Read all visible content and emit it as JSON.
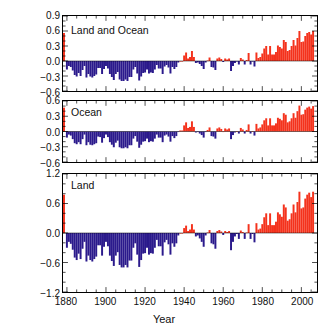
{
  "chart_data": {
    "type": "bar",
    "title": "",
    "xlabel": "Year",
    "ylabel": "Temperature anomaly (°C)",
    "xlim": [
      1878,
      2008
    ],
    "grid": false,
    "legend": "none",
    "colors": {
      "positive": "#f4321c",
      "negative": "#2b1a8c",
      "axis": "#000000"
    },
    "xticks": [
      1880,
      1900,
      1920,
      1940,
      1960,
      1980,
      2000
    ],
    "panels": [
      {
        "name": "Land and Ocean",
        "ylabel_ticks": [
          "0.9",
          "0.6",
          "0.3",
          "0.0",
          "-0.3",
          "-0.6"
        ],
        "ylim": [
          -0.6,
          0.9
        ],
        "ytick_values": [
          0.9,
          0.6,
          0.3,
          0.0,
          -0.3,
          -0.6
        ],
        "x": [
          1880,
          1881,
          1882,
          1883,
          1884,
          1885,
          1886,
          1887,
          1888,
          1889,
          1890,
          1891,
          1892,
          1893,
          1894,
          1895,
          1896,
          1897,
          1898,
          1899,
          1900,
          1901,
          1902,
          1903,
          1904,
          1905,
          1906,
          1907,
          1908,
          1909,
          1910,
          1911,
          1912,
          1913,
          1914,
          1915,
          1916,
          1917,
          1918,
          1919,
          1920,
          1921,
          1922,
          1923,
          1924,
          1925,
          1926,
          1927,
          1928,
          1929,
          1930,
          1931,
          1932,
          1933,
          1934,
          1935,
          1936,
          1937,
          1938,
          1939,
          1940,
          1941,
          1942,
          1943,
          1944,
          1945,
          1946,
          1947,
          1948,
          1949,
          1950,
          1951,
          1952,
          1953,
          1954,
          1955,
          1956,
          1957,
          1958,
          1959,
          1960,
          1961,
          1962,
          1963,
          1964,
          1965,
          1966,
          1967,
          1968,
          1969,
          1970,
          1971,
          1972,
          1973,
          1974,
          1975,
          1976,
          1977,
          1978,
          1979,
          1980,
          1981,
          1982,
          1983,
          1984,
          1985,
          1986,
          1987,
          1988,
          1989,
          1990,
          1991,
          1992,
          1993,
          1994,
          1995,
          1996,
          1997,
          1998,
          1999,
          2000,
          2001,
          2002,
          2003,
          2004,
          2005,
          2006
        ],
        "values": [
          -0.17,
          -0.1,
          -0.12,
          -0.19,
          -0.28,
          -0.31,
          -0.24,
          -0.3,
          -0.18,
          -0.1,
          -0.33,
          -0.26,
          -0.31,
          -0.33,
          -0.3,
          -0.27,
          -0.14,
          -0.14,
          -0.26,
          -0.16,
          -0.1,
          -0.15,
          -0.26,
          -0.32,
          -0.38,
          -0.26,
          -0.22,
          -0.37,
          -0.4,
          -0.4,
          -0.37,
          -0.4,
          -0.32,
          -0.32,
          -0.17,
          -0.12,
          -0.25,
          -0.39,
          -0.31,
          -0.24,
          -0.23,
          -0.17,
          -0.25,
          -0.23,
          -0.24,
          -0.17,
          -0.08,
          -0.15,
          -0.15,
          -0.26,
          -0.11,
          -0.08,
          -0.13,
          -0.25,
          -0.12,
          -0.16,
          -0.12,
          -0.03,
          0.0,
          0.0,
          0.11,
          0.17,
          0.05,
          0.08,
          0.2,
          0.08,
          -0.04,
          -0.03,
          -0.06,
          -0.1,
          -0.16,
          -0.03,
          0.01,
          0.07,
          -0.12,
          -0.13,
          -0.18,
          0.05,
          0.07,
          0.04,
          -0.02,
          0.05,
          0.03,
          0.05,
          -0.2,
          -0.1,
          -0.04,
          -0.01,
          -0.07,
          0.06,
          0.03,
          -0.07,
          0.02,
          0.16,
          -0.07,
          -0.01,
          -0.11,
          0.17,
          0.06,
          0.08,
          0.15,
          0.25,
          0.3,
          0.13,
          0.3,
          0.13,
          0.13,
          0.18,
          0.31,
          0.28,
          0.25,
          0.42,
          0.38,
          0.2,
          0.22,
          0.3,
          0.42,
          0.31,
          0.46,
          0.6,
          0.38,
          0.39,
          0.5,
          0.56,
          0.58,
          0.53,
          0.6,
          0.56
        ]
      },
      {
        "name": "Ocean",
        "ylabel_ticks": [
          "0.6",
          "0.3",
          "0.0",
          "-0.3",
          "-0.6"
        ],
        "ylim": [
          -0.6,
          0.6
        ],
        "ytick_values": [
          0.6,
          0.3,
          0.0,
          -0.3,
          -0.6
        ],
        "x": [
          1880,
          1881,
          1882,
          1883,
          1884,
          1885,
          1886,
          1887,
          1888,
          1889,
          1890,
          1891,
          1892,
          1893,
          1894,
          1895,
          1896,
          1897,
          1898,
          1899,
          1900,
          1901,
          1902,
          1903,
          1904,
          1905,
          1906,
          1907,
          1908,
          1909,
          1910,
          1911,
          1912,
          1913,
          1914,
          1915,
          1916,
          1917,
          1918,
          1919,
          1920,
          1921,
          1922,
          1923,
          1924,
          1925,
          1926,
          1927,
          1928,
          1929,
          1930,
          1931,
          1932,
          1933,
          1934,
          1935,
          1936,
          1937,
          1938,
          1939,
          1940,
          1941,
          1942,
          1943,
          1944,
          1945,
          1946,
          1947,
          1948,
          1949,
          1950,
          1951,
          1952,
          1953,
          1954,
          1955,
          1956,
          1957,
          1958,
          1959,
          1960,
          1961,
          1962,
          1963,
          1964,
          1965,
          1966,
          1967,
          1968,
          1969,
          1970,
          1971,
          1972,
          1973,
          1974,
          1975,
          1976,
          1977,
          1978,
          1979,
          1980,
          1981,
          1982,
          1983,
          1984,
          1985,
          1986,
          1987,
          1988,
          1989,
          1990,
          1991,
          1992,
          1993,
          1994,
          1995,
          1996,
          1997,
          1998,
          1999,
          2000,
          2001,
          2002,
          2003,
          2004,
          2005,
          2006
        ],
        "values": [
          -0.12,
          -0.06,
          -0.08,
          -0.15,
          -0.23,
          -0.25,
          -0.21,
          -0.25,
          -0.15,
          -0.06,
          -0.27,
          -0.21,
          -0.26,
          -0.27,
          -0.25,
          -0.23,
          -0.1,
          -0.11,
          -0.22,
          -0.13,
          -0.06,
          -0.11,
          -0.21,
          -0.26,
          -0.31,
          -0.22,
          -0.18,
          -0.31,
          -0.33,
          -0.33,
          -0.31,
          -0.33,
          -0.27,
          -0.27,
          -0.14,
          -0.09,
          -0.2,
          -0.32,
          -0.26,
          -0.2,
          -0.19,
          -0.14,
          -0.21,
          -0.19,
          -0.2,
          -0.14,
          -0.06,
          -0.12,
          -0.12,
          -0.21,
          -0.08,
          -0.06,
          -0.1,
          -0.2,
          -0.09,
          -0.13,
          -0.09,
          -0.01,
          0.02,
          0.02,
          0.12,
          0.18,
          0.07,
          0.09,
          0.2,
          0.09,
          -0.02,
          -0.01,
          -0.04,
          -0.07,
          -0.12,
          -0.01,
          0.03,
          0.08,
          -0.09,
          -0.1,
          -0.14,
          0.06,
          0.08,
          0.05,
          0.0,
          0.06,
          0.04,
          0.06,
          -0.15,
          -0.07,
          -0.02,
          0.01,
          -0.04,
          0.07,
          0.04,
          -0.04,
          0.03,
          0.14,
          -0.04,
          0.01,
          -0.08,
          0.15,
          0.06,
          0.08,
          0.14,
          0.22,
          0.26,
          0.12,
          0.26,
          0.12,
          0.12,
          0.16,
          0.27,
          0.25,
          0.22,
          0.36,
          0.33,
          0.18,
          0.2,
          0.26,
          0.36,
          0.27,
          0.4,
          0.51,
          0.33,
          0.34,
          0.43,
          0.47,
          0.49,
          0.45,
          0.5,
          0.47
        ]
      },
      {
        "name": "Land",
        "ylabel_ticks": [
          "1.2",
          "0.6",
          "0.0",
          "-0.6",
          "-1.2"
        ],
        "ylim": [
          -1.2,
          1.2
        ],
        "ytick_values": [
          1.2,
          0.6,
          0.0,
          -0.6,
          -1.2
        ],
        "x": [
          1880,
          1881,
          1882,
          1883,
          1884,
          1885,
          1886,
          1887,
          1888,
          1889,
          1890,
          1891,
          1892,
          1893,
          1894,
          1895,
          1896,
          1897,
          1898,
          1899,
          1900,
          1901,
          1902,
          1903,
          1904,
          1905,
          1906,
          1907,
          1908,
          1909,
          1910,
          1911,
          1912,
          1913,
          1914,
          1915,
          1916,
          1917,
          1918,
          1919,
          1920,
          1921,
          1922,
          1923,
          1924,
          1925,
          1926,
          1927,
          1928,
          1929,
          1930,
          1931,
          1932,
          1933,
          1934,
          1935,
          1936,
          1937,
          1938,
          1939,
          1940,
          1941,
          1942,
          1943,
          1944,
          1945,
          1946,
          1947,
          1948,
          1949,
          1950,
          1951,
          1952,
          1953,
          1954,
          1955,
          1956,
          1957,
          1958,
          1959,
          1960,
          1961,
          1962,
          1963,
          1964,
          1965,
          1966,
          1967,
          1968,
          1969,
          1970,
          1971,
          1972,
          1973,
          1974,
          1975,
          1976,
          1977,
          1978,
          1979,
          1980,
          1981,
          1982,
          1983,
          1984,
          1985,
          1986,
          1987,
          1988,
          1989,
          1990,
          1991,
          1992,
          1993,
          1994,
          1995,
          1996,
          1997,
          1998,
          1999,
          2000,
          2001,
          2002,
          2003,
          2004,
          2005,
          2006
        ],
        "values": [
          -0.3,
          -0.18,
          -0.22,
          -0.34,
          -0.5,
          -0.55,
          -0.42,
          -0.53,
          -0.32,
          -0.18,
          -0.58,
          -0.46,
          -0.55,
          -0.58,
          -0.53,
          -0.48,
          -0.25,
          -0.25,
          -0.46,
          -0.28,
          -0.18,
          -0.27,
          -0.46,
          -0.57,
          -0.67,
          -0.46,
          -0.39,
          -0.65,
          -0.7,
          -0.7,
          -0.65,
          -0.7,
          -0.56,
          -0.56,
          -0.3,
          -0.21,
          -0.44,
          -0.69,
          -0.55,
          -0.42,
          -0.41,
          -0.3,
          -0.44,
          -0.41,
          -0.42,
          -0.3,
          -0.14,
          -0.27,
          -0.27,
          -0.46,
          -0.19,
          -0.14,
          -0.23,
          -0.44,
          -0.21,
          -0.28,
          -0.21,
          -0.05,
          0.0,
          0.0,
          0.1,
          0.15,
          0.04,
          0.07,
          0.18,
          0.07,
          -0.07,
          -0.05,
          -0.11,
          -0.18,
          -0.28,
          -0.05,
          0.01,
          0.06,
          -0.21,
          -0.23,
          -0.32,
          0.04,
          0.06,
          0.03,
          -0.04,
          0.04,
          0.02,
          0.04,
          -0.35,
          -0.18,
          -0.07,
          -0.02,
          -0.12,
          0.05,
          0.02,
          -0.12,
          0.01,
          0.18,
          -0.12,
          -0.02,
          -0.19,
          0.2,
          0.07,
          0.09,
          0.18,
          0.32,
          0.4,
          0.16,
          0.4,
          0.16,
          0.16,
          0.23,
          0.42,
          0.38,
          0.33,
          0.58,
          0.52,
          0.25,
          0.28,
          0.4,
          0.58,
          0.42,
          0.63,
          0.84,
          0.5,
          0.52,
          0.7,
          0.78,
          0.82,
          0.73,
          0.84,
          0.78
        ]
      }
    ]
  }
}
